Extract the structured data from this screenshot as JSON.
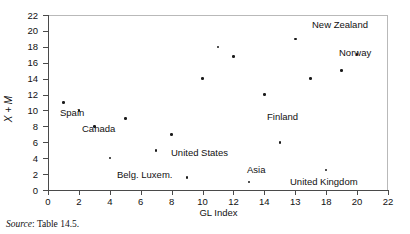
{
  "figure": {
    "source_note_label": "Source",
    "source_note_sep": ": ",
    "source_note_value": "Table 14.5."
  },
  "chart_data": {
    "type": "scatter",
    "title": "",
    "xlabel": "GL Index",
    "ylabel": "X + M",
    "xlim": [
      0,
      22
    ],
    "ylim": [
      0,
      22
    ],
    "grid": false,
    "legend": "none",
    "x_ticks": [
      "0",
      "2",
      "4",
      "6",
      "8",
      "10",
      "12",
      "14",
      "13",
      "18",
      "20",
      "22"
    ],
    "x_tick_values": [
      0,
      2,
      4,
      6,
      8,
      10,
      12,
      14,
      16,
      18,
      20,
      22
    ],
    "y_ticks": [
      "0",
      "2",
      "4",
      "6",
      "8",
      "10",
      "12",
      "14",
      "16",
      "18",
      "20",
      "22"
    ],
    "y_tick_values": [
      0,
      2,
      4,
      6,
      8,
      10,
      12,
      14,
      16,
      18,
      20,
      22
    ],
    "marker_color": "#1a1a1a",
    "points": [
      {
        "x": 1,
        "y": 11.0
      },
      {
        "x": 2,
        "y": 10.0
      },
      {
        "x": 3,
        "y": 8.0
      },
      {
        "x": 4,
        "y": 4.0
      },
      {
        "x": 5,
        "y": 9.0
      },
      {
        "x": 7,
        "y": 5.0
      },
      {
        "x": 8,
        "y": 7.0
      },
      {
        "x": 9,
        "y": 1.6
      },
      {
        "x": 10,
        "y": 14.0
      },
      {
        "x": 11,
        "y": 18.0
      },
      {
        "x": 12,
        "y": 16.8
      },
      {
        "x": 13,
        "y": 1.0
      },
      {
        "x": 14,
        "y": 12.0
      },
      {
        "x": 15,
        "y": 6.0
      },
      {
        "x": 16,
        "y": 19.0
      },
      {
        "x": 17,
        "y": 14.0
      },
      {
        "x": 18,
        "y": 2.5
      },
      {
        "x": 19,
        "y": 15.0
      },
      {
        "x": 20,
        "y": 17.0
      }
    ],
    "annotations": [
      {
        "text": "Spain",
        "px": 60,
        "py": 108
      },
      {
        "text": "Canada",
        "px": 82,
        "py": 124
      },
      {
        "text": "United States",
        "px": 171,
        "py": 148
      },
      {
        "text": "Belg. Luxem.",
        "px": 117,
        "py": 170
      },
      {
        "text": "Asia",
        "px": 247,
        "py": 165
      },
      {
        "text": "United Kingdom",
        "px": 290,
        "py": 177
      },
      {
        "text": "Finland",
        "px": 267,
        "py": 112
      },
      {
        "text": "New Zealand",
        "px": 312,
        "py": 20
      },
      {
        "text": "Norway",
        "px": 339,
        "py": 48
      }
    ]
  }
}
